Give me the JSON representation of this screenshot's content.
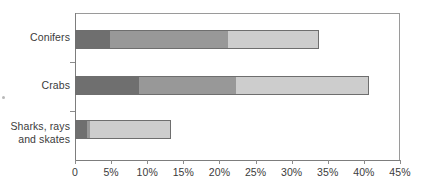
{
  "chart_data": {
    "type": "bar",
    "orientation": "horizontal",
    "stacked": true,
    "title": "",
    "subtitle": "",
    "xlabel": "",
    "ylabel": "",
    "categories": [
      "Conifers",
      "Crabs",
      "Sharks, rays and skates"
    ],
    "category_lines": [
      [
        "Conifers"
      ],
      [
        "Crabs"
      ],
      [
        "Sharks, rays",
        "and skates"
      ]
    ],
    "series": [
      {
        "name": "segment-1",
        "color": "#6f6f6f",
        "values": [
          5.0,
          9.0,
          1.8
        ]
      },
      {
        "name": "segment-2",
        "color": "#989898",
        "values": [
          16.5,
          13.5,
          0.6
        ]
      },
      {
        "name": "segment-3",
        "color": "#cdcdcd",
        "values": [
          12.5,
          18.5,
          11.2
        ]
      }
    ],
    "totals": [
      34.0,
      41.0,
      13.6
    ],
    "xlim": [
      0,
      45
    ],
    "xticks": [
      0,
      5,
      10,
      15,
      20,
      25,
      30,
      35,
      40,
      45
    ],
    "xtick_labels": [
      "0",
      "5%",
      "10%",
      "15%",
      "20%",
      "25%",
      "30%",
      "35%",
      "40%",
      "45%"
    ],
    "grid": false,
    "legend": "none",
    "axis_color": "#7d7d7d",
    "bar_outline_color": "#6e6e6e",
    "text_color": "#3b3b3b",
    "background": "#ffffff"
  }
}
